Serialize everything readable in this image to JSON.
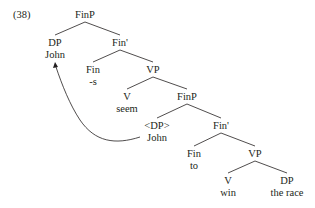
{
  "example_number": "(38)",
  "nodes": [
    {
      "id": "n0",
      "label": "FinP",
      "word": ""
    },
    {
      "id": "n1",
      "label": "DP",
      "word": "John"
    },
    {
      "id": "n2",
      "label": "Fin'",
      "word": ""
    },
    {
      "id": "n3",
      "label": "Fin",
      "word": "-s"
    },
    {
      "id": "n4",
      "label": "VP",
      "word": ""
    },
    {
      "id": "n5",
      "label": "V",
      "word": "seem"
    },
    {
      "id": "n6",
      "label": "FinP",
      "word": ""
    },
    {
      "id": "n7",
      "label": "<DP>",
      "word": "John"
    },
    {
      "id": "n8",
      "label": "Fin'",
      "word": ""
    },
    {
      "id": "n9",
      "label": "Fin",
      "word": "to"
    },
    {
      "id": "n10",
      "label": "VP",
      "word": ""
    },
    {
      "id": "n11",
      "label": "V",
      "word": "win"
    },
    {
      "id": "n12",
      "label": "DP",
      "word": "the race"
    }
  ],
  "edges": [
    [
      "n0",
      "n1"
    ],
    [
      "n0",
      "n2"
    ],
    [
      "n2",
      "n3"
    ],
    [
      "n2",
      "n4"
    ],
    [
      "n4",
      "n5"
    ],
    [
      "n4",
      "n6"
    ],
    [
      "n6",
      "n7"
    ],
    [
      "n6",
      "n8"
    ],
    [
      "n8",
      "n9"
    ],
    [
      "n8",
      "n10"
    ],
    [
      "n10",
      "n11"
    ],
    [
      "n10",
      "n12"
    ]
  ],
  "movement_arrow": {
    "from": "n7",
    "to": "n1",
    "description": "movement of John from lower DP copy to Spec,FinP"
  }
}
